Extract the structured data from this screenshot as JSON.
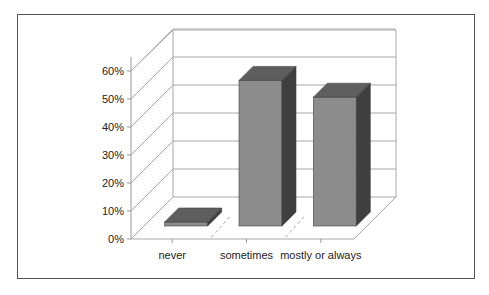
{
  "chart_data": {
    "type": "bar",
    "style": "3d-column",
    "title": "",
    "xlabel": "",
    "ylabel": "",
    "categories": [
      "never",
      "sometimes",
      "mostly or always"
    ],
    "values": [
      1,
      52,
      46
    ],
    "value_unit": "%",
    "ylim": [
      0,
      60
    ],
    "yticks": [
      "0%",
      "10%",
      "20%",
      "30%",
      "40%",
      "50%",
      "60%"
    ],
    "grid": true,
    "legend": null,
    "colors": {
      "bar_front": "#8c8c8c",
      "bar_top": "#5e5e5e",
      "bar_side": "#3f3f3f",
      "gridline": "#a8a8a8",
      "frame": "#555555"
    }
  }
}
